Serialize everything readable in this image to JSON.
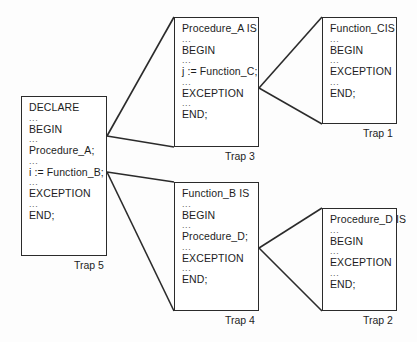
{
  "diagram": {
    "background_color": "#fdfdfd",
    "line_color": "#2b2b2b",
    "text_color": "#1d1d1d",
    "boxes": [
      {
        "id": "trap5",
        "label": "Trap 5",
        "lines": [
          "DECLARE",
          "...",
          "BEGIN",
          "...",
          "Procedure_A;",
          "...",
          "i := Function_B;",
          "...",
          "EXCEPTION",
          "...",
          "END;"
        ]
      },
      {
        "id": "trap3",
        "label": "Trap 3",
        "lines": [
          "Procedure_A IS",
          "...",
          "BEGIN",
          "...",
          "j := Function_C;",
          "...",
          "EXCEPTION",
          "...",
          "END;"
        ]
      },
      {
        "id": "trap1",
        "label": "Trap 1",
        "lines": [
          "Function_CIS",
          "...",
          "BEGIN",
          "...",
          "EXCEPTION",
          "...",
          "END;"
        ]
      },
      {
        "id": "trap4",
        "label": "Trap 4",
        "lines": [
          "Function_B IS",
          "...",
          "BEGIN",
          "...",
          "Procedure_D;",
          "...",
          "EXCEPTION",
          "...",
          "END;"
        ]
      },
      {
        "id": "trap2",
        "label": "Trap 2",
        "lines": [
          "Procedure_D IS",
          "...",
          "BEGIN",
          "...",
          "EXCEPTION",
          "...",
          "END;"
        ]
      }
    ],
    "connectors": [
      {
        "from": "trap5",
        "to": "trap3",
        "from_line": "Procedure_A;"
      },
      {
        "from": "trap5",
        "to": "trap4",
        "from_line": "i := Function_B;"
      },
      {
        "from": "trap3",
        "to": "trap1",
        "from_line": "j := Function_C;"
      },
      {
        "from": "trap4",
        "to": "trap2",
        "from_line": "Procedure_D;"
      }
    ]
  }
}
